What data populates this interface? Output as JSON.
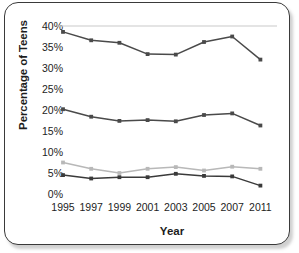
{
  "chart_data": {
    "type": "line",
    "title": "",
    "xlabel": "Year",
    "ylabel": "Percentage of Teens",
    "categories": [
      "1995",
      "1997",
      "1999",
      "2001",
      "2003",
      "2005",
      "2007",
      "2011"
    ],
    "ytick_labels": [
      "40%",
      "35%",
      "30%",
      "25%",
      "20%",
      "15%",
      "10%",
      "5%",
      "0%"
    ],
    "ytick_values": [
      40,
      35,
      30,
      25,
      20,
      15,
      10,
      5,
      0
    ],
    "ylim": [
      0,
      40
    ],
    "grid": false,
    "legend": "none",
    "series": [
      {
        "name": "series-1",
        "color": "#4a4a4a",
        "values": [
          38.6,
          36.6,
          36.0,
          33.3,
          33.2,
          36.2,
          37.5,
          32.0
        ]
      },
      {
        "name": "series-2",
        "color": "#4a4a4a",
        "values": [
          20.2,
          18.4,
          17.4,
          17.6,
          17.3,
          18.8,
          19.2,
          16.3
        ]
      },
      {
        "name": "series-3",
        "color": "#b8b8b8",
        "values": [
          7.5,
          6.0,
          5.0,
          6.0,
          6.4,
          5.6,
          6.5,
          6.0
        ]
      },
      {
        "name": "series-4",
        "color": "#3a3a3a",
        "values": [
          4.5,
          3.7,
          4.0,
          4.0,
          4.8,
          4.3,
          4.2,
          2.0
        ]
      }
    ],
    "top_rule": {
      "value": 40,
      "color": "#c9c9c9"
    }
  }
}
